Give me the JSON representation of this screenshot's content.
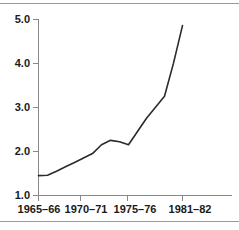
{
  "figure": {
    "background_color": "#ffffff",
    "rule_color": "#9a9a9a",
    "axis_color": "#888888",
    "line_color": "#2b2b2b"
  },
  "chart_data": {
    "type": "line",
    "title": "",
    "subtitle": "",
    "xlabel": "",
    "ylabel": "",
    "grid": false,
    "legend": "none",
    "xlim": [
      1965,
      1982
    ],
    "ylim": [
      1.0,
      5.0
    ],
    "y_ticks": [
      "1.0",
      "2.0",
      "3.0",
      "4.0",
      "5.0"
    ],
    "y_tick_values": [
      1.0,
      2.0,
      3.0,
      4.0,
      5.0
    ],
    "x_ticks": [
      "1965–66",
      "1970–71",
      "1975–76",
      "1981–82"
    ],
    "x_tick_values": [
      1965,
      1970,
      1975,
      1981
    ],
    "series": [
      {
        "name": "series-1",
        "x": [
          1965,
          1966,
          1967,
          1968,
          1969,
          1970,
          1971,
          1972,
          1973,
          1974,
          1975,
          1976,
          1977,
          1978,
          1979,
          1980,
          1981
        ],
        "values": [
          1.45,
          1.46,
          1.55,
          1.65,
          1.75,
          1.85,
          1.95,
          2.15,
          2.25,
          2.22,
          2.15,
          2.45,
          2.75,
          3.0,
          3.25,
          4.0,
          4.85
        ]
      }
    ]
  }
}
